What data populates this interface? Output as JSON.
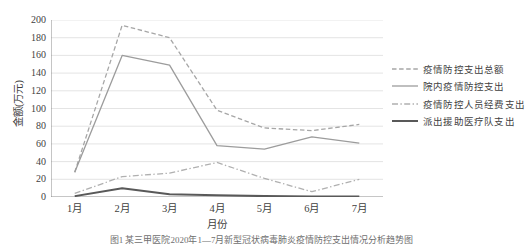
{
  "chart_data": {
    "type": "line",
    "title": "",
    "xlabel": "月份",
    "ylabel": "金额(万元)",
    "categories": [
      "1月",
      "2月",
      "3月",
      "4月",
      "5月",
      "6月",
      "7月"
    ],
    "ylim": [
      0,
      200
    ],
    "ytick_values": [
      200,
      180,
      160,
      140,
      120,
      100,
      80,
      60,
      40,
      20,
      0
    ],
    "ytick_labels": [
      "200",
      "180",
      "160",
      "140",
      "120",
      "100",
      "80",
      "60",
      "40",
      "20",
      "0"
    ],
    "grid": true,
    "grid_axis": "y",
    "legend_position": "right",
    "series": [
      {
        "name": "疫情防控支出总额",
        "values": [
          28,
          194,
          180,
          98,
          78,
          75,
          82
        ],
        "color": "#a6a6a6",
        "style": "dashed",
        "width": 1.3
      },
      {
        "name": "院内疫情防控支出",
        "values": [
          28,
          160,
          149,
          58,
          54,
          68,
          61
        ],
        "color": "#9c9c9c",
        "style": "solid",
        "width": 1.3
      },
      {
        "name": "疫情防控人员经费支出",
        "values": [
          4,
          23,
          27,
          39,
          21,
          6,
          20
        ],
        "color": "#b0b0b0",
        "style": "dashdot",
        "width": 1.3
      },
      {
        "name": "派出援助医疗队支出",
        "values": [
          1,
          10,
          3,
          2,
          1,
          0.5,
          0.5
        ],
        "color": "#595959",
        "style": "solid",
        "width": 2.0
      }
    ]
  },
  "caption": "图1 某三甲医院2020年1—7月新型冠状病毒肺炎疫情防控支出情况分析趋势图",
  "colors": {
    "axis": "#808080",
    "gridline": "#d9d9d9",
    "text": "#3f3f3f",
    "background": "#ffffff"
  }
}
